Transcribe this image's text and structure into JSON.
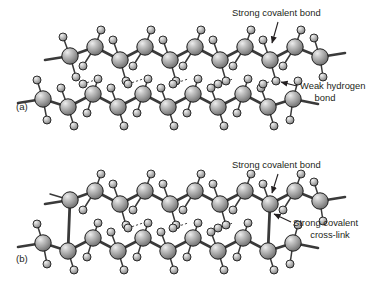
{
  "figure": {
    "background": "#ffffff",
    "text_color": "#231f20",
    "bond_color": "#3a3a3a",
    "sphere_light": "#e8e8e8",
    "sphere_mid": "#9a9a9a",
    "sphere_dark": "#5a5a5a",
    "sphere_outline": "#1a1a1a"
  },
  "panels": [
    {
      "id": "a",
      "panel_label": "(a)",
      "annotations": [
        {
          "name": "strong-covalent-bond",
          "lines": [
            "Strong covalent bond"
          ],
          "align": "start"
        },
        {
          "name": "weak-hydrogen-bond",
          "lines": [
            "Weak hydrogen",
            "bond"
          ],
          "align": "center"
        }
      ]
    },
    {
      "id": "b",
      "panel_label": "(b)",
      "annotations": [
        {
          "name": "strong-covalent-bond",
          "lines": [
            "Strong covalent bond"
          ],
          "align": "start"
        },
        {
          "name": "strong-covalent-cross-link",
          "lines": [
            "Strong covalent",
            "cross-link"
          ],
          "align": "center"
        }
      ]
    }
  ],
  "labels": {
    "panel_a": "(a)",
    "panel_b": "(b)",
    "strong_covalent_bond": "Strong covalent bond",
    "weak_hydrogen_1": "Weak hydrogen",
    "weak_hydrogen_2": "bond",
    "cross_link_1": "Strong covalent",
    "cross_link_2": "cross-link"
  }
}
